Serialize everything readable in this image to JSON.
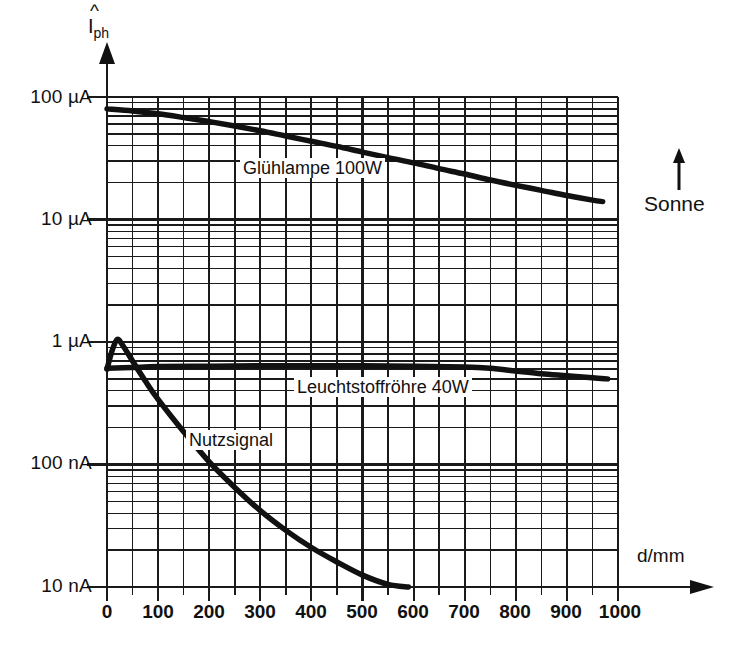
{
  "chart_data": {
    "type": "line",
    "title": "",
    "xlabel": "d/mm",
    "ylabel": "I_ph",
    "ylabel_display": "Îph",
    "x_unit": "mm",
    "y_unit": "A",
    "yscale": "log",
    "xscale": "linear",
    "xlim": [
      0,
      1000
    ],
    "ylim": [
      1e-08,
      0.0001
    ],
    "grid": true,
    "legend_position": "inline-annotations",
    "x_ticks": [
      0,
      100,
      200,
      300,
      400,
      500,
      600,
      700,
      800,
      900,
      1000
    ],
    "x_tick_labels": [
      "0",
      "100",
      "200",
      "300",
      "400",
      "500",
      "600",
      "700",
      "800",
      "900",
      "1000"
    ],
    "x_minor_step": 50,
    "y_ticks": [
      0.0001,
      1e-05,
      1e-06,
      1e-07,
      1e-08
    ],
    "y_tick_labels": [
      "100 µA",
      "10 µA",
      "1 µA",
      "100 nA",
      "10 nA"
    ],
    "series": [
      {
        "name": "Glühlampe 100W",
        "label": "Glühlampe  100W",
        "unit": "A",
        "x": [
          0,
          50,
          100,
          150,
          200,
          250,
          300,
          350,
          400,
          450,
          500,
          550,
          600,
          650,
          700,
          750,
          800,
          850,
          900,
          950,
          970
        ],
        "values": [
          8e-05,
          7.7e-05,
          7.3e-05,
          6.8e-05,
          6.3e-05,
          5.8e-05,
          5.3e-05,
          4.8e-05,
          4.35e-05,
          3.95e-05,
          3.55e-05,
          3.2e-05,
          2.9e-05,
          2.6e-05,
          2.35e-05,
          2.1e-05,
          1.9e-05,
          1.73e-05,
          1.57e-05,
          1.44e-05,
          1.4e-05
        ]
      },
      {
        "name": "Leuchtstoffröhre 40W",
        "label": "Leuchtstoffröhre  40W",
        "unit": "A",
        "x": [
          0,
          50,
          100,
          200,
          300,
          400,
          500,
          600,
          700,
          750,
          800,
          850,
          900,
          950,
          980
        ],
        "values": [
          6.1e-07,
          6.2e-07,
          6.3e-07,
          6.35e-07,
          6.4e-07,
          6.4e-07,
          6.4e-07,
          6.35e-07,
          6.25e-07,
          6.1e-07,
          5.8e-07,
          5.5e-07,
          5.3e-07,
          5.1e-07,
          5e-07
        ]
      },
      {
        "name": "Nutzsignal",
        "label": "Nutzsignal",
        "unit": "A",
        "x": [
          0,
          10,
          20,
          30,
          50,
          75,
          100,
          150,
          200,
          250,
          300,
          350,
          400,
          450,
          500,
          550,
          590
        ],
        "values": [
          6e-07,
          8.5e-07,
          1.05e-06,
          9.5e-07,
          7e-07,
          4.8e-07,
          3.4e-07,
          1.85e-07,
          1.05e-07,
          6.5e-08,
          4.2e-08,
          2.9e-08,
          2.1e-08,
          1.6e-08,
          1.25e-08,
          1.05e-08,
          1e-08
        ]
      }
    ],
    "annotations": [
      {
        "text": "Glühlampe  100W",
        "x": 230,
        "y": 4.2e-05
      },
      {
        "text": "Leuchtstoffröhre  40W",
        "x": 560,
        "y": 4e-07
      },
      {
        "text": "Nutzsignal",
        "x": 240,
        "y": 1.1e-07
      },
      {
        "text": "Sonne",
        "x": 1080,
        "y": 1.2e-05
      }
    ]
  },
  "axes": {
    "y_axis_title": "I",
    "y_axis_subscript": "ph",
    "x_axis_title": "d/mm",
    "y_tick_labels": [
      "100 µA",
      "10 µA",
      "1 µA",
      "100 nA",
      "10 nA"
    ],
    "x_tick_labels": [
      "0",
      "100",
      "200",
      "300",
      "400",
      "500",
      "600",
      "700",
      "800",
      "900",
      "1000"
    ]
  },
  "annotations": {
    "curve_gluehlampe": "Glühlampe  100W",
    "curve_leuchtstoffroehre": "Leuchtstoffröhre  40W",
    "curve_nutzsignal": "Nutzsignal",
    "sonne": "Sonne"
  },
  "colors": {
    "ink": "#111111",
    "grid": "#1a1a1a",
    "background": "#ffffff"
  }
}
